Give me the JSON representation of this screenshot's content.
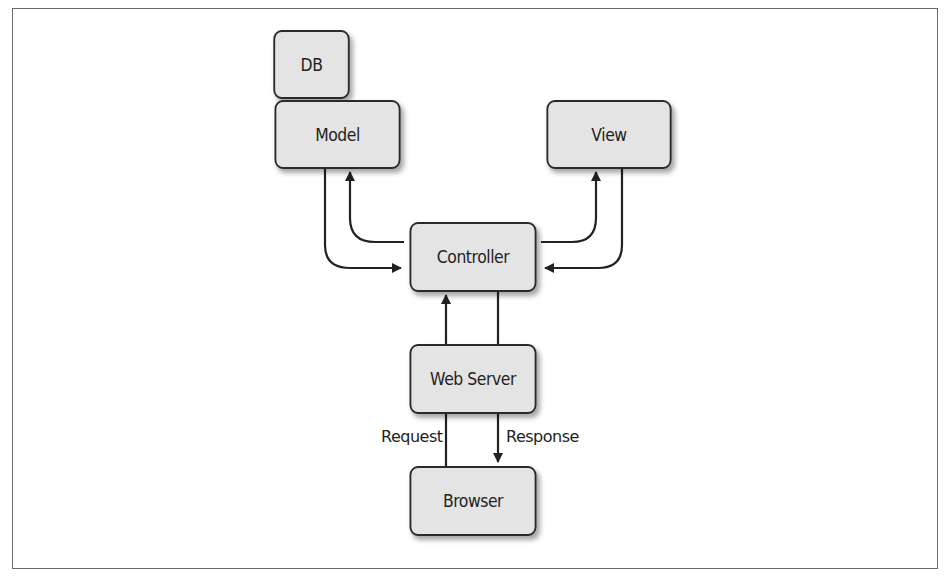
{
  "diagram": {
    "nodes": {
      "db": "DB",
      "model": "Model",
      "view": "View",
      "controller": "Controller",
      "web_server": "Web Server",
      "browser": "Browser"
    },
    "edge_labels": {
      "request": "Request",
      "response": "Response"
    },
    "edges": [
      {
        "from": "controller",
        "to": "model"
      },
      {
        "from": "model",
        "to": "controller"
      },
      {
        "from": "controller",
        "to": "view"
      },
      {
        "from": "view",
        "to": "controller"
      },
      {
        "from": "web_server",
        "to": "controller"
      },
      {
        "from": "controller",
        "to": "web_server"
      },
      {
        "from": "browser",
        "to": "web_server",
        "label": "Request"
      },
      {
        "from": "web_server",
        "to": "browser",
        "label": "Response"
      }
    ],
    "colors": {
      "box_fill": "#e4e4e4",
      "stroke": "#2a2a2a",
      "frame": "#6a6a6a"
    }
  }
}
